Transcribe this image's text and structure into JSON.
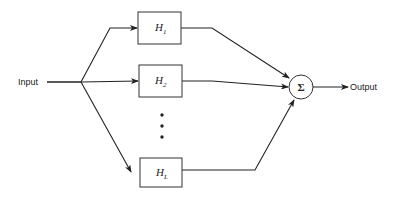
{
  "diagram": {
    "type": "block-diagram",
    "input_label": "Input",
    "output_label": "Output",
    "summer_symbol": "Σ",
    "blocks": [
      {
        "id": "h1",
        "base": "H",
        "subscript": "1"
      },
      {
        "id": "h2",
        "base": "H",
        "subscript": "2"
      },
      {
        "id": "hL",
        "base": "H",
        "subscript": "L"
      }
    ],
    "ellipsis": "vertical dots (additional branches)",
    "colors": {
      "line": "#222222",
      "background": "#ffffff"
    }
  }
}
